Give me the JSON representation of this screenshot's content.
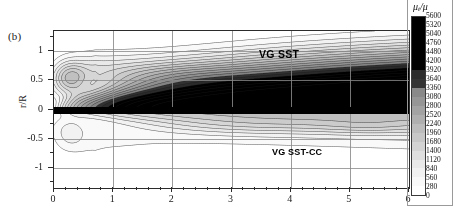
{
  "figure": {
    "panel_label": "(b)",
    "annotations": [
      {
        "text": "VG SST",
        "name": "label-vg-sst"
      },
      {
        "text": "VG SST-CC",
        "name": "label-vg-sst-cc"
      }
    ]
  },
  "chart_data": {
    "type": "heatmap",
    "title": "",
    "subtitle": "",
    "panel": "(b)",
    "xlabel": "",
    "ylabel": "r/R",
    "colorbar_label": "μ_t/μ",
    "colorbar_label_parts": {
      "mu": "μ",
      "sub": "t",
      "denom": "/μ"
    },
    "xlim": [
      0,
      6
    ],
    "ylim": [
      -1.35,
      1.35
    ],
    "x_ticks": [
      0,
      1,
      2,
      3,
      4,
      5,
      6
    ],
    "x_tick_labels": [
      "0",
      "1",
      "2",
      "3",
      "4",
      "5",
      "6"
    ],
    "x_minor_per_major": 5,
    "y_ticks": [
      1,
      0.5,
      0,
      -0.5,
      -1
    ],
    "y_tick_labels": [
      "1",
      "0.5",
      "0",
      "-0.5",
      "-1"
    ],
    "grid": true,
    "legend_position": "none",
    "colorbar": {
      "min": 0,
      "max": 5600,
      "step": 280,
      "n_bands": 20,
      "ticks": [
        5600,
        5320,
        5040,
        4760,
        4480,
        4200,
        3920,
        3640,
        3360,
        3080,
        2800,
        2520,
        2240,
        1960,
        1680,
        1400,
        1120,
        840,
        560,
        280,
        0
      ],
      "orientation": "vertical",
      "colormap": "grayscale-inverted",
      "high_color": "#000000",
      "low_color": "#ffffff"
    },
    "annotations": [
      {
        "text": "VG SST",
        "x": 4.1,
        "y": 0.82
      },
      {
        "text": "VG SST-CC",
        "x": 4.3,
        "y": -0.62
      }
    ]
  }
}
